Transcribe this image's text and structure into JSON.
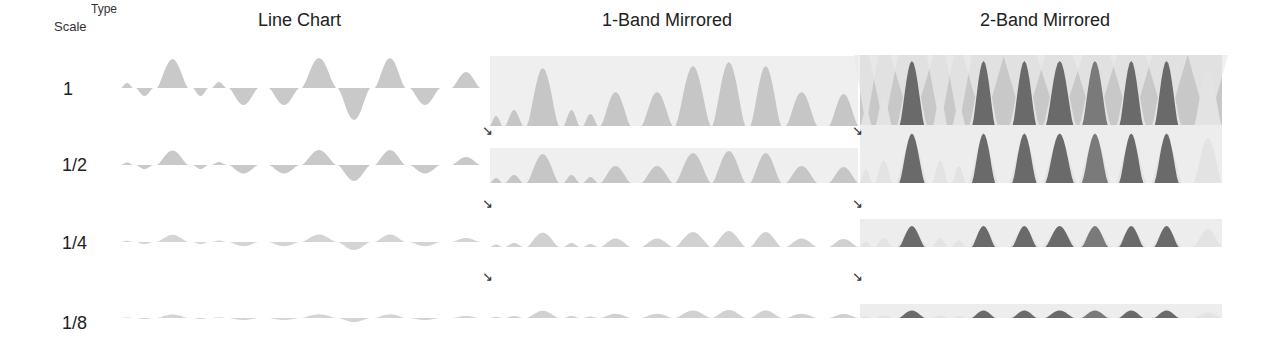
{
  "corner": {
    "type_label": "Type",
    "scale_label": "Scale"
  },
  "columns": [
    {
      "label": "Line Chart"
    },
    {
      "label": "1-Band Mirrored"
    },
    {
      "label": "2-Band Mirrored"
    }
  ],
  "rows": [
    {
      "label": "1",
      "scale": 1
    },
    {
      "label": "1/2",
      "scale": 0.5
    },
    {
      "label": "1/4",
      "scale": 0.25
    },
    {
      "label": "1/8",
      "scale": 0.125
    }
  ],
  "arrow_glyph": "↘",
  "colors": {
    "line_fill": "#c9c9c9",
    "band1_bg": "#efefef",
    "band1_fill": "#c6c6c6",
    "band2_bg": "#c8c8c8",
    "band2_light": "#e9e9e9",
    "band2_dark": "#6a6a6a",
    "band2_mid": "#7a7a7a"
  },
  "chart_data": {
    "type": "area",
    "xlabel": "",
    "ylabel": "",
    "column_labels": [
      "Line Chart",
      "1-Band Mirrored",
      "2-Band Mirrored"
    ],
    "row_labels": [
      "1",
      "1/2",
      "1/4",
      "1/8"
    ],
    "segments": [
      {
        "x0": 121,
        "x1": 133,
        "value": 5
      },
      {
        "x0": 136,
        "x1": 153,
        "value": -8
      },
      {
        "x0": 157,
        "x1": 188,
        "value": 29
      },
      {
        "x0": 193,
        "x1": 208,
        "value": -8
      },
      {
        "x0": 212,
        "x1": 226,
        "value": 6
      },
      {
        "x0": 229,
        "x1": 258,
        "value": -17
      },
      {
        "x0": 269,
        "x1": 299,
        "value": -17
      },
      {
        "x0": 302,
        "x1": 336,
        "value": 30
      },
      {
        "x0": 338,
        "x1": 370,
        "value": -32
      },
      {
        "x0": 375,
        "x1": 405,
        "value": 30
      },
      {
        "x0": 410,
        "x1": 440,
        "value": -17
      },
      {
        "x0": 452,
        "x1": 480,
        "value": 16
      }
    ],
    "legend": [],
    "grid": false
  }
}
